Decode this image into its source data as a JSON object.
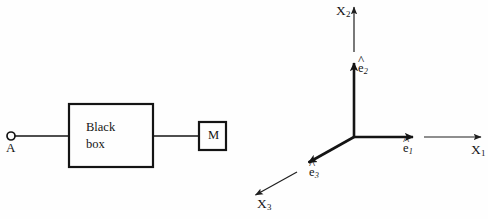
{
  "figure": {
    "background_color": "#fefefe",
    "ink_color": "#141414",
    "panels": [
      {
        "id": "black-box-circuit",
        "description": "Two-terminal black box driving a meter"
      },
      {
        "id": "cartesian-basis-triad",
        "description": "Right-handed orthonormal basis triad with coordinate axes"
      }
    ]
  },
  "circuit": {
    "terminal": {
      "label": "A",
      "marker": "open-circle",
      "center_x": 11,
      "center_y": 136,
      "radius": 4
    },
    "black_box": {
      "line1": "Black",
      "line2": "box",
      "x": 69,
      "y": 104,
      "width": 84,
      "height": 63,
      "border_width": 2,
      "border_color": "#141414"
    },
    "meter": {
      "label": "M",
      "x": 199,
      "y": 122,
      "width": 27,
      "height": 28,
      "border_width": 2,
      "border_color": "#141414"
    },
    "wires": [
      {
        "name": "terminal-to-box",
        "x1": 15,
        "y1": 136,
        "x2": 69,
        "y2": 136
      },
      {
        "name": "box-to-meter",
        "x1": 153,
        "y1": 136,
        "x2": 199,
        "y2": 136
      }
    ],
    "wire_width": 1.6
  },
  "axes": {
    "origin": {
      "x": 354,
      "y": 137
    },
    "thick_width": 2.6,
    "thin_width": 1.2,
    "basis_vectors": [
      {
        "name": "e1",
        "symbol": "e",
        "subscript": "1",
        "accent": "hat",
        "tip_x": 414,
        "tip_y": 137,
        "direction": "right"
      },
      {
        "name": "e2",
        "symbol": "e",
        "subscript": "2",
        "accent": "hat",
        "tip_x": 354,
        "tip_y": 62,
        "direction": "up"
      },
      {
        "name": "e3",
        "symbol": "e",
        "subscript": "3",
        "accent": "hat",
        "tip_x": 307,
        "tip_y": 164,
        "direction": "down-left"
      }
    ],
    "coordinate_axes": [
      {
        "name": "X1",
        "symbol": "X",
        "subscript": "1",
        "from_x": 424,
        "from_y": 137,
        "tip_x": 482,
        "tip_y": 137,
        "direction": "right"
      },
      {
        "name": "X2",
        "symbol": "X",
        "subscript": "2",
        "from_x": 354,
        "from_y": 52,
        "tip_x": 354,
        "tip_y": 6,
        "direction": "up"
      },
      {
        "name": "X3",
        "symbol": "X",
        "subscript": "3",
        "from_x": 297,
        "from_y": 172,
        "tip_x": 254,
        "tip_y": 196,
        "direction": "down-left"
      }
    ]
  }
}
